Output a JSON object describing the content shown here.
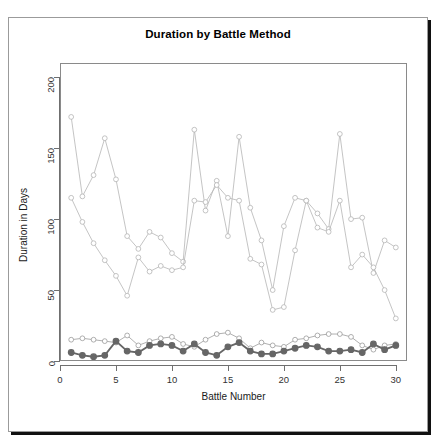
{
  "chart_data": {
    "type": "line",
    "title": "Duration by Battle Method",
    "xlabel": "Battle Number",
    "ylabel": "Duration in Days",
    "xlim": [
      0,
      31
    ],
    "ylim": [
      0,
      210
    ],
    "xticks": [
      0,
      5,
      10,
      15,
      20,
      25,
      30
    ],
    "yticks": [
      0,
      50,
      100,
      150,
      200
    ],
    "grid": false,
    "legend": "none",
    "x": [
      1,
      2,
      3,
      4,
      5,
      6,
      7,
      8,
      9,
      10,
      11,
      12,
      13,
      14,
      15,
      16,
      17,
      18,
      19,
      20,
      21,
      22,
      23,
      24,
      25,
      26,
      27,
      28,
      29,
      30
    ],
    "series": [
      {
        "name": "method-a-upper",
        "color": "#b5b5b5",
        "marker": "open-circle",
        "values": [
          172,
          116,
          131,
          157,
          128,
          88,
          79,
          91,
          87,
          76,
          70,
          163,
          106,
          127,
          88,
          158,
          108,
          85,
          50,
          95,
          115,
          113,
          104,
          93,
          160,
          100,
          101,
          62,
          85,
          80
        ]
      },
      {
        "name": "method-b-upper",
        "color": "#b5b5b5",
        "marker": "open-circle",
        "values": [
          115,
          98,
          83,
          71,
          60,
          46,
          73,
          63,
          67,
          64,
          66,
          113,
          112,
          124,
          115,
          113,
          72,
          68,
          36,
          38,
          78,
          113,
          94,
          91,
          113,
          66,
          75,
          66,
          50,
          30
        ]
      },
      {
        "name": "method-c-lower-open",
        "color": "#9a9a9a",
        "marker": "open-circle",
        "values": [
          15,
          16,
          15,
          14,
          13,
          18,
          11,
          14,
          16,
          17,
          12,
          10,
          15,
          19,
          20,
          16,
          9,
          13,
          11,
          10,
          15,
          16,
          18,
          19,
          19,
          17,
          11,
          8,
          11,
          12
        ]
      },
      {
        "name": "method-d-lower-filled",
        "color": "#666666",
        "marker": "filled-circle",
        "values": [
          6,
          4,
          3,
          4,
          14,
          7,
          6,
          11,
          12,
          11,
          7,
          12,
          6,
          4,
          10,
          13,
          7,
          5,
          5,
          7,
          9,
          11,
          10,
          7,
          7,
          8,
          6,
          12,
          8,
          11
        ]
      }
    ]
  }
}
